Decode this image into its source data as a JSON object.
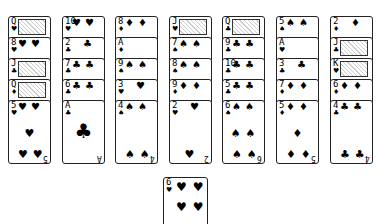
{
  "game": "Solitaire",
  "tableau": [
    {
      "column": 1,
      "cards": [
        {
          "rank": "Q",
          "suit": "♥"
        },
        {
          "rank": "8",
          "suit": "♥"
        },
        {
          "rank": "J",
          "suit": "♣"
        },
        {
          "rank": "Q",
          "suit": "♦"
        },
        {
          "rank": "5",
          "suit": "♥"
        }
      ]
    },
    {
      "column": 2,
      "cards": [
        {
          "rank": "10",
          "suit": "♥"
        },
        {
          "rank": "2",
          "suit": "♣"
        },
        {
          "rank": "7",
          "suit": "♣"
        },
        {
          "rank": "6",
          "suit": "♣"
        },
        {
          "rank": "A",
          "suit": "♣"
        }
      ]
    },
    {
      "column": 3,
      "cards": [
        {
          "rank": "8",
          "suit": "♦"
        },
        {
          "rank": "A",
          "suit": "♦"
        },
        {
          "rank": "9",
          "suit": "♠"
        },
        {
          "rank": "3",
          "suit": "♥"
        },
        {
          "rank": "4",
          "suit": "♠"
        }
      ]
    },
    {
      "column": 4,
      "cards": [
        {
          "rank": "J",
          "suit": "♥"
        },
        {
          "rank": "7",
          "suit": "♠"
        },
        {
          "rank": "8",
          "suit": "♠"
        },
        {
          "rank": "9",
          "suit": "♦"
        },
        {
          "rank": "2",
          "suit": "♥"
        }
      ]
    },
    {
      "column": 5,
      "cards": [
        {
          "rank": "Q",
          "suit": "♣"
        },
        {
          "rank": "9",
          "suit": "♣"
        },
        {
          "rank": "10",
          "suit": "♣"
        },
        {
          "rank": "5",
          "suit": "♣"
        },
        {
          "rank": "6",
          "suit": "♠"
        }
      ]
    },
    {
      "column": 6,
      "cards": [
        {
          "rank": "5",
          "suit": "♠"
        },
        {
          "rank": "A",
          "suit": "♥"
        },
        {
          "rank": "3",
          "suit": "♣"
        },
        {
          "rank": "7",
          "suit": "♦"
        },
        {
          "rank": "5",
          "suit": "♦"
        }
      ]
    },
    {
      "column": 7,
      "cards": [
        {
          "rank": "2",
          "suit": "♦"
        },
        {
          "rank": "J",
          "suit": "♣"
        },
        {
          "rank": "K",
          "suit": "♥"
        },
        {
          "rank": "6",
          "suit": "♦"
        },
        {
          "rank": "4",
          "suit": "♣"
        }
      ]
    }
  ],
  "loose_card": {
    "rank": "6",
    "suit": "♥"
  }
}
